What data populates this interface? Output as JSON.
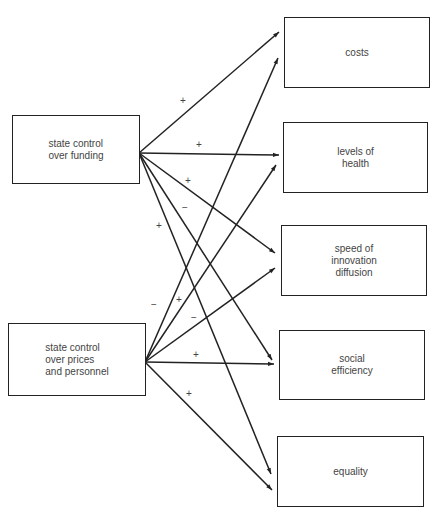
{
  "sources": [
    {
      "id": "funding",
      "label": "state control\nover funding"
    },
    {
      "id": "prices",
      "label": "state control\nover prices\nand personnel"
    }
  ],
  "targets": [
    {
      "id": "costs",
      "label": "costs"
    },
    {
      "id": "health",
      "label": "levels of\nhealth"
    },
    {
      "id": "innovation",
      "label": "speed of\ninnovation\ndiffusion"
    },
    {
      "id": "efficiency",
      "label": "social\nefficiency"
    },
    {
      "id": "equality",
      "label": "equality"
    }
  ],
  "links": [
    {
      "from": "funding",
      "to": "costs",
      "sign": "+"
    },
    {
      "from": "funding",
      "to": "health",
      "sign": "+"
    },
    {
      "from": "funding",
      "to": "innovation",
      "sign": "+"
    },
    {
      "from": "funding",
      "to": "efficiency",
      "sign": "−"
    },
    {
      "from": "funding",
      "to": "equality",
      "sign": "+"
    },
    {
      "from": "prices",
      "to": "costs",
      "sign": "−"
    },
    {
      "from": "prices",
      "to": "health",
      "sign": "+"
    },
    {
      "from": "prices",
      "to": "innovation",
      "sign": "−"
    },
    {
      "from": "prices",
      "to": "efficiency",
      "sign": "+"
    },
    {
      "from": "prices",
      "to": "equality",
      "sign": "+"
    }
  ],
  "colors": {
    "line": "#222222",
    "text": "#444444",
    "background": "#ffffff"
  }
}
